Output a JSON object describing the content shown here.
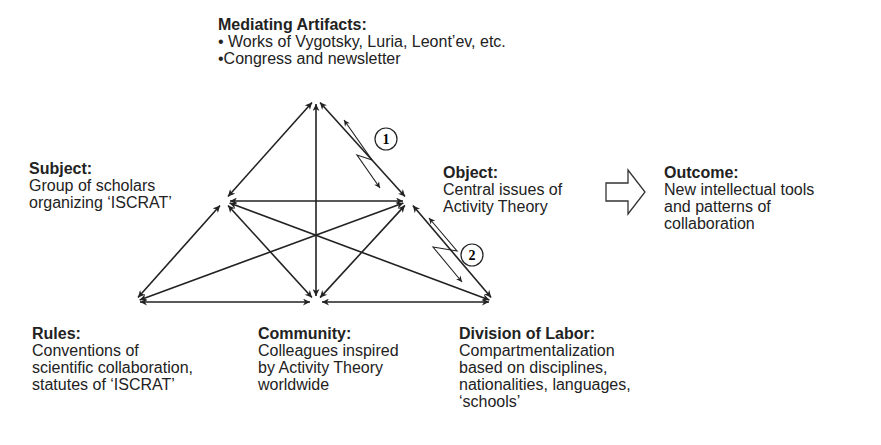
{
  "nodes": {
    "mediating_artifacts": {
      "title": "Mediating Artifacts:",
      "lines": [
        "• Works of Vygotsky, Luria, Leont’ev, etc.",
        "•Congress and newsletter"
      ]
    },
    "subject": {
      "title": "Subject:",
      "lines": [
        "Group of scholars",
        "organizing ‘ISCRAT’"
      ]
    },
    "object": {
      "title": "Object:",
      "lines": [
        "Central issues of",
        "Activity Theory"
      ]
    },
    "outcome": {
      "title": "Outcome:",
      "lines": [
        "New intellectual tools",
        "and patterns of",
        "collaboration"
      ]
    },
    "rules": {
      "title": "Rules:",
      "lines": [
        "Conventions of",
        "scientific collaboration,",
        "statutes of ‘ISCRAT’"
      ]
    },
    "community": {
      "title": "Community:",
      "lines": [
        "Colleagues inspired",
        "by Activity Theory",
        "worldwide"
      ]
    },
    "division_of_labor": {
      "title": "Division of Labor:",
      "lines": [
        "Compartmentalization",
        "based on disciplines,",
        "nationalities, languages,",
        "‘schools’"
      ]
    }
  },
  "contradictions": [
    {
      "label": "1",
      "between": [
        "mediating_artifacts",
        "object"
      ]
    },
    {
      "label": "2",
      "between": [
        "object",
        "division_of_labor"
      ]
    }
  ],
  "edges": [
    [
      "mediating_artifacts",
      "subject"
    ],
    [
      "mediating_artifacts",
      "object"
    ],
    [
      "mediating_artifacts",
      "community"
    ],
    [
      "subject",
      "object"
    ],
    [
      "subject",
      "rules"
    ],
    [
      "subject",
      "community"
    ],
    [
      "subject",
      "division_of_labor"
    ],
    [
      "object",
      "rules"
    ],
    [
      "object",
      "community"
    ],
    [
      "object",
      "division_of_labor"
    ],
    [
      "rules",
      "community"
    ],
    [
      "community",
      "division_of_labor"
    ]
  ],
  "colors": {
    "line": "#222222",
    "background": "#ffffff"
  }
}
